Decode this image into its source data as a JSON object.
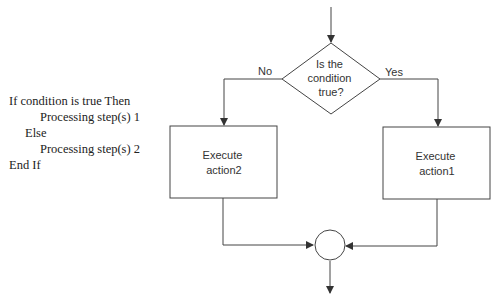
{
  "pseudocode": {
    "lines": [
      {
        "indent": 0,
        "text": "If condition is true Then"
      },
      {
        "indent": 2,
        "text": "Processing step(s) 1"
      },
      {
        "indent": 1,
        "text": "Else"
      },
      {
        "indent": 2,
        "text": "Processing step(s) 2"
      },
      {
        "indent": 0,
        "text": "End If"
      }
    ]
  },
  "flowchart": {
    "decision": {
      "lines": [
        "Is the",
        "condition",
        "true?"
      ]
    },
    "branch_no_label": "No",
    "branch_yes_label": "Yes",
    "left_box": {
      "lines": [
        "Execute",
        "action2"
      ]
    },
    "right_box": {
      "lines": [
        "Execute",
        "action1"
      ]
    },
    "stroke_color": "#444444"
  }
}
